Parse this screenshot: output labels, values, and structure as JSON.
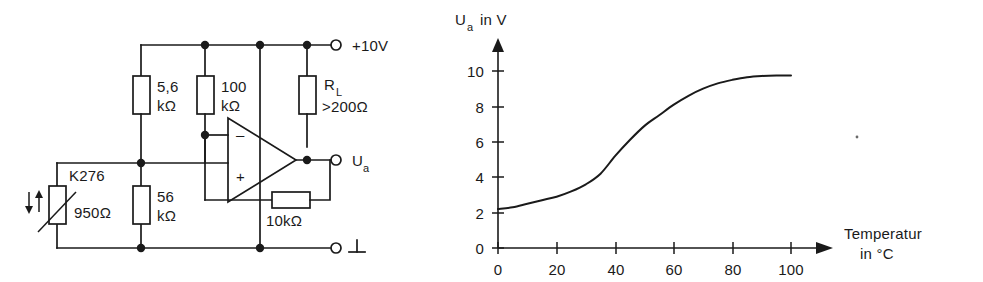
{
  "circuit": {
    "name": "thermistor-bridge-opamp-circuit",
    "components": {
      "r1_value": "5,6",
      "r1_unit": "kΩ",
      "r2_value": "100",
      "r2_unit": "kΩ",
      "rl_name": "R",
      "rl_sub": "L",
      "rl_value": ">200Ω",
      "r3_value": "56",
      "r3_unit": "kΩ",
      "rf_value": "10kΩ",
      "sensor_type": "K276",
      "sensor_value": "950Ω",
      "opamp_inverting": "–",
      "opamp_noninverting": "+"
    },
    "terminals": {
      "supply": "+10V",
      "output_label": "U",
      "output_sub": "a",
      "ground_glyph": "⊥"
    }
  },
  "chart_data": {
    "type": "line",
    "title": "",
    "ylabel": "U_a in V",
    "ylabel_main": "U",
    "ylabel_sub": "a",
    "ylabel_rest": "in  V",
    "xlabel_line1": "Temperatur",
    "xlabel_line2": "in  °C",
    "xlabel": "Temperatur in °C",
    "xlim": [
      0,
      110
    ],
    "ylim": [
      0,
      11.5
    ],
    "xticks": [
      0,
      20,
      40,
      60,
      80,
      100
    ],
    "xticklabels": [
      "0",
      "20",
      "40",
      "60",
      "80",
      "100"
    ],
    "yticks": [
      0,
      2,
      4,
      6,
      8,
      10
    ],
    "yticklabels": [
      "0",
      "2",
      "4",
      "6",
      "8",
      "10"
    ],
    "grid": false,
    "legend": null,
    "series": [
      {
        "name": "Ua(T)",
        "x": [
          0,
          5,
          10,
          15,
          20,
          25,
          30,
          35,
          40,
          45,
          50,
          55,
          60,
          65,
          70,
          75,
          80,
          85,
          90,
          95,
          100
        ],
        "values": [
          2.2,
          2.3,
          2.5,
          2.7,
          2.9,
          3.2,
          3.6,
          4.2,
          5.2,
          6.1,
          6.9,
          7.5,
          8.1,
          8.6,
          9.0,
          9.3,
          9.5,
          9.65,
          9.72,
          9.75,
          9.75
        ]
      }
    ]
  }
}
